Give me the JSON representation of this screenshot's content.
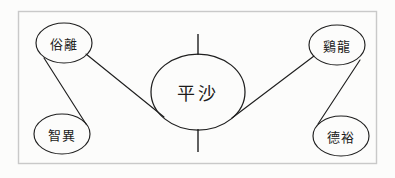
{
  "figure": {
    "title": "",
    "background_color": "#fdfdfc",
    "frame_color": "#c9c9c9",
    "ink_color": "#1f1f1f",
    "nodes": [
      {
        "id": "songni",
        "label": "俗離",
        "position": "top-left",
        "cx": 64,
        "cy": 43,
        "rx": 28,
        "ry": 20
      },
      {
        "id": "jiri",
        "label": "智異",
        "position": "bottom-left",
        "cx": 62,
        "cy": 134,
        "rx": 28,
        "ry": 20
      },
      {
        "id": "pyeongsa",
        "label": "平沙",
        "position": "center",
        "cx": 198,
        "cy": 92,
        "rx": 47,
        "ry": 38
      },
      {
        "id": "gyeryong",
        "label": "鷄龍",
        "position": "top-right",
        "cx": 337,
        "cy": 45,
        "rx": 28,
        "ry": 20
      },
      {
        "id": "deogyu",
        "label": "德裕",
        "position": "bottom-right",
        "cx": 341,
        "cy": 136,
        "rx": 28,
        "ry": 20
      }
    ],
    "links": [
      {
        "from": "songni",
        "to": "jiri"
      },
      {
        "from": "songni",
        "to": "pyeongsa"
      },
      {
        "from": "pyeongsa",
        "to": "gyeryong"
      },
      {
        "from": "gyeryong",
        "to": "deogyu"
      }
    ],
    "ticks": [
      {
        "id": "top-tick",
        "orientation": "vertical",
        "x": 198,
        "y1": 34,
        "y2": 55
      },
      {
        "id": "bottom-tick",
        "orientation": "vertical",
        "x": 198,
        "y1": 129,
        "y2": 152
      }
    ],
    "frame": {
      "x": 18,
      "y": 11,
      "width": 358,
      "height": 152
    }
  }
}
